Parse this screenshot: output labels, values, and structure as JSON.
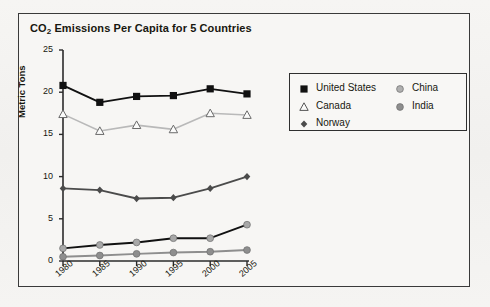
{
  "chart_data": {
    "type": "line",
    "title": "CO2 Emissions Per Capita for 5 Countries",
    "title_main": "CO",
    "title_sub": "2",
    "title_rest": " Emissions Per Capita for 5 Countries",
    "xlabel": "",
    "ylabel": "Metric Tons",
    "categories": [
      "1980",
      "1985",
      "1990",
      "1995",
      "2000",
      "2005"
    ],
    "x": [
      1980,
      1985,
      1990,
      1995,
      2000,
      2005
    ],
    "ylim": [
      0,
      25
    ],
    "yticks": [
      0,
      5,
      10,
      15,
      20,
      25
    ],
    "grid": false,
    "legend_position": "upper right",
    "series": [
      {
        "name": "United States",
        "values": [
          20.8,
          18.8,
          19.5,
          19.6,
          20.4,
          19.8
        ],
        "marker": "filled-square",
        "marker_color": "#111111",
        "line_color": "#111111"
      },
      {
        "name": "Canada",
        "values": [
          17.4,
          15.4,
          16.1,
          15.6,
          17.5,
          17.3
        ],
        "marker": "open-triangle",
        "marker_color": "#ffffff",
        "line_color": "#b9b9b9"
      },
      {
        "name": "Norway",
        "values": [
          8.6,
          8.4,
          7.4,
          7.5,
          8.6,
          10.0
        ],
        "marker": "filled-diamond",
        "marker_color": "#4b4b4b",
        "line_color": "#4b4b4b"
      },
      {
        "name": "China",
        "values": [
          1.5,
          1.9,
          2.2,
          2.7,
          2.7,
          4.3
        ],
        "marker": "filled-circle",
        "marker_color": "#a8a8a8",
        "line_color": "#111111"
      },
      {
        "name": "India",
        "values": [
          0.5,
          0.65,
          0.85,
          1.0,
          1.1,
          1.3
        ],
        "marker": "filled-circle",
        "marker_color": "#8e8e8e",
        "line_color": "#8e8e8e"
      }
    ]
  },
  "legend": {
    "entries": [
      {
        "label": "United States",
        "marker": "filled-square",
        "color": "#111111"
      },
      {
        "label": "Canada",
        "marker": "open-triangle",
        "color": "#333333"
      },
      {
        "label": "Norway",
        "marker": "filled-diamond",
        "color": "#4b4b4b"
      },
      {
        "label": "China",
        "marker": "filled-circle",
        "color": "#b0b0b0"
      },
      {
        "label": "India",
        "marker": "filled-circle",
        "color": "#8e8e8e"
      }
    ]
  },
  "colors": {
    "frame": "#3a3a3a",
    "background": "#f4f3f1",
    "axis": "#2b2b2b",
    "text": "#17170f"
  }
}
